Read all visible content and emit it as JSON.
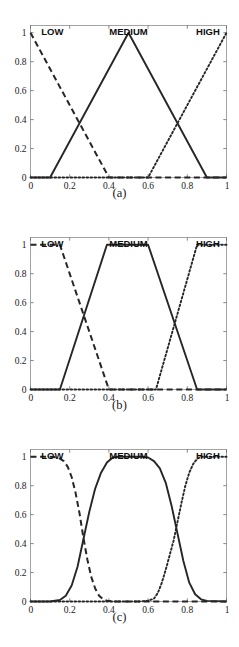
{
  "figure": {
    "name": "fuzzy-membership-functions",
    "panel_count": 3,
    "background": "#ffffff",
    "line_color": "#262626"
  },
  "axes": {
    "x_ticks": [
      "0",
      "0.2",
      "0.4",
      "0.6",
      "0.8",
      "1"
    ],
    "x_tick_values": [
      0,
      0.2,
      0.4,
      0.6,
      0.8,
      1
    ],
    "y_ticks": [
      "0",
      "0.2",
      "0.4",
      "0.6",
      "0.8",
      "1"
    ],
    "y_tick_values": [
      0,
      0.2,
      0.4,
      0.6,
      0.8,
      1
    ],
    "xlim": [
      0,
      1
    ],
    "ylim": [
      0,
      1.05
    ]
  },
  "series_labels": {
    "low": "LOW",
    "medium": "MEDIUM",
    "high": "HIGH"
  },
  "captions": {
    "a": "(a)",
    "b": "(b)",
    "c": "(c)"
  },
  "chart_data": [
    {
      "type": "line",
      "title": "(a)",
      "xlabel": "",
      "ylabel": "",
      "xlim": [
        0,
        1
      ],
      "ylim": [
        0,
        1.05
      ],
      "grid": false,
      "legend": "inline-top-labels",
      "xticks": [
        0,
        0.2,
        0.4,
        0.6,
        0.8,
        1
      ],
      "yticks": [
        0,
        0.2,
        0.4,
        0.6,
        0.8,
        1
      ],
      "series": [
        {
          "name": "LOW",
          "style": "dashed",
          "shape": "triangular",
          "points": [
            [
              0,
              1
            ],
            [
              0.4,
              0
            ],
            [
              1,
              0
            ]
          ]
        },
        {
          "name": "MEDIUM",
          "style": "solid",
          "shape": "triangular",
          "points": [
            [
              0,
              0
            ],
            [
              0.1,
              0
            ],
            [
              0.5,
              1
            ],
            [
              0.9,
              0
            ],
            [
              1,
              0
            ]
          ]
        },
        {
          "name": "HIGH",
          "style": "dotted",
          "shape": "triangular",
          "points": [
            [
              0,
              0
            ],
            [
              0.6,
              0
            ],
            [
              1,
              1
            ]
          ]
        }
      ],
      "annotations": [
        {
          "text": "LOW",
          "x": 0.07,
          "y": 1.04
        },
        {
          "text": "MEDIUM",
          "x": 0.5,
          "y": 1.04
        },
        {
          "text": "HIGH",
          "x": 0.93,
          "y": 1.04
        }
      ]
    },
    {
      "type": "line",
      "title": "(b)",
      "xlabel": "",
      "ylabel": "",
      "xlim": [
        0,
        1
      ],
      "ylim": [
        0,
        1.05
      ],
      "grid": false,
      "legend": "inline-top-labels",
      "xticks": [
        0,
        0.2,
        0.4,
        0.6,
        0.8,
        1
      ],
      "yticks": [
        0,
        0.2,
        0.4,
        0.6,
        0.8,
        1
      ],
      "series": [
        {
          "name": "LOW",
          "style": "dashed",
          "shape": "trapezoidal",
          "points": [
            [
              0,
              1
            ],
            [
              0.15,
              1
            ],
            [
              0.4,
              0
            ],
            [
              1,
              0
            ]
          ]
        },
        {
          "name": "MEDIUM",
          "style": "solid",
          "shape": "trapezoidal",
          "points": [
            [
              0,
              0
            ],
            [
              0.15,
              0
            ],
            [
              0.39,
              1
            ],
            [
              0.6,
              1
            ],
            [
              0.85,
              0
            ],
            [
              1,
              0
            ]
          ]
        },
        {
          "name": "HIGH",
          "style": "dotted",
          "shape": "trapezoidal",
          "points": [
            [
              0,
              0
            ],
            [
              0.64,
              0
            ],
            [
              0.85,
              1
            ],
            [
              1,
              1
            ]
          ]
        }
      ],
      "annotations": [
        {
          "text": "LOW",
          "x": 0.07,
          "y": 1.04
        },
        {
          "text": "MEDIUM",
          "x": 0.5,
          "y": 1.04
        },
        {
          "text": "HIGH",
          "x": 0.93,
          "y": 1.04
        }
      ]
    },
    {
      "type": "line",
      "title": "(c)",
      "xlabel": "",
      "ylabel": "",
      "xlim": [
        0,
        1
      ],
      "ylim": [
        0,
        1.05
      ],
      "grid": false,
      "legend": "inline-top-labels",
      "xticks": [
        0,
        0.2,
        0.4,
        0.6,
        0.8,
        1
      ],
      "yticks": [
        0,
        0.2,
        0.4,
        0.6,
        0.8,
        1
      ],
      "series": [
        {
          "name": "LOW",
          "style": "dashed",
          "shape": "sigmoidal-smooth",
          "description": "flat at 1 until x=0.15, falls smoothly through 0.42 at x=0.27, reaches 0 near x=0.38",
          "points": [
            [
              0,
              1
            ],
            [
              0.05,
              1
            ],
            [
              0.1,
              1
            ],
            [
              0.14,
              0.995
            ],
            [
              0.17,
              0.97
            ],
            [
              0.19,
              0.93
            ],
            [
              0.21,
              0.86
            ],
            [
              0.23,
              0.75
            ],
            [
              0.25,
              0.61
            ],
            [
              0.27,
              0.44
            ],
            [
              0.29,
              0.29
            ],
            [
              0.31,
              0.17
            ],
            [
              0.33,
              0.09
            ],
            [
              0.35,
              0.04
            ],
            [
              0.37,
              0.015
            ],
            [
              0.39,
              0.005
            ],
            [
              0.42,
              0
            ],
            [
              0.6,
              0
            ],
            [
              0.8,
              0
            ],
            [
              1,
              0
            ]
          ]
        },
        {
          "name": "MEDIUM",
          "style": "solid",
          "shape": "gaussian-flat-top",
          "description": "rises from 0 near x=0.17, plateau at 1 between x=0.43 and x=0.58, falls to 0 near x=0.85",
          "points": [
            [
              0,
              0
            ],
            [
              0.1,
              0
            ],
            [
              0.15,
              0.01
            ],
            [
              0.18,
              0.04
            ],
            [
              0.21,
              0.11
            ],
            [
              0.24,
              0.24
            ],
            [
              0.27,
              0.43
            ],
            [
              0.3,
              0.62
            ],
            [
              0.33,
              0.78
            ],
            [
              0.36,
              0.89
            ],
            [
              0.39,
              0.96
            ],
            [
              0.42,
              0.995
            ],
            [
              0.45,
              1
            ],
            [
              0.52,
              1
            ],
            [
              0.57,
              1
            ],
            [
              0.6,
              0.995
            ],
            [
              0.63,
              0.97
            ],
            [
              0.66,
              0.92
            ],
            [
              0.69,
              0.82
            ],
            [
              0.72,
              0.66
            ],
            [
              0.75,
              0.47
            ],
            [
              0.78,
              0.28
            ],
            [
              0.81,
              0.13
            ],
            [
              0.84,
              0.05
            ],
            [
              0.87,
              0.015
            ],
            [
              0.9,
              0.004
            ],
            [
              1,
              0
            ]
          ]
        },
        {
          "name": "HIGH",
          "style": "dotted",
          "shape": "sigmoidal-smooth",
          "description": "flat at 0 until x=0.62, rises smoothly through 0.40 at x=0.73, plateau at 1 from x=0.85",
          "points": [
            [
              0,
              0
            ],
            [
              0.3,
              0
            ],
            [
              0.55,
              0
            ],
            [
              0.6,
              0.005
            ],
            [
              0.63,
              0.02
            ],
            [
              0.65,
              0.06
            ],
            [
              0.67,
              0.13
            ],
            [
              0.69,
              0.22
            ],
            [
              0.71,
              0.32
            ],
            [
              0.73,
              0.42
            ],
            [
              0.75,
              0.55
            ],
            [
              0.77,
              0.68
            ],
            [
              0.79,
              0.8
            ],
            [
              0.81,
              0.89
            ],
            [
              0.83,
              0.95
            ],
            [
              0.85,
              0.985
            ],
            [
              0.87,
              1
            ],
            [
              0.92,
              1
            ],
            [
              1,
              1
            ]
          ]
        }
      ],
      "annotations": [
        {
          "text": "LOW",
          "x": 0.07,
          "y": 1.04
        },
        {
          "text": "MEDIUM",
          "x": 0.5,
          "y": 1.04
        },
        {
          "text": "HIGH",
          "x": 0.93,
          "y": 1.04
        }
      ]
    }
  ]
}
